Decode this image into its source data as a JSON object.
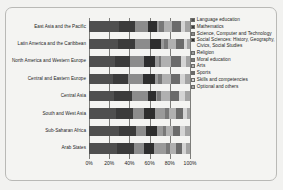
{
  "chart_data": {
    "type": "bar",
    "subtype": "stacked-horizontal-100-percent",
    "title": "",
    "xlabel": "",
    "ylabel": "",
    "xlim": [
      0,
      100
    ],
    "xticks": [
      0,
      20,
      40,
      60,
      80,
      100
    ],
    "xtick_labels": [
      "0%",
      "20%",
      "40%",
      "60%",
      "80%",
      "100%"
    ],
    "grid": true,
    "legend_position": "right",
    "categories": [
      "East Asia and the Pacific",
      "Latin America and the Caribbean",
      "North America and Western Europe",
      "Central and Eastern Europe",
      "Central Asia",
      "South and West Asia",
      "Sub-Saharan Africa",
      "Arab States"
    ],
    "series": [
      {
        "name": "Language education",
        "color": "#4f4f4f",
        "values": [
          30,
          29,
          26,
          24,
          25,
          27,
          30,
          28
        ]
      },
      {
        "name": "Mathematics",
        "color": "#3b3b3b",
        "values": [
          16,
          17,
          15,
          15,
          18,
          17,
          17,
          17
        ]
      },
      {
        "name": "Science, Computer and Technology",
        "color": "#8c8c8c",
        "values": [
          12,
          14,
          13,
          14,
          15,
          10,
          9,
          9
        ]
      },
      {
        "name": "Social Sciences: History, Geography, Civics, Social Studies",
        "color": "#2e2e2e",
        "values": [
          9,
          11,
          11,
          12,
          8,
          11,
          11,
          10
        ]
      },
      {
        "name": "Religion",
        "color": "#9a9a9a",
        "values": [
          2,
          3,
          4,
          3,
          1,
          10,
          6,
          12
        ]
      },
      {
        "name": "Moral education",
        "color": "#787878",
        "values": [
          5,
          4,
          2,
          4,
          4,
          4,
          3,
          4
        ]
      },
      {
        "name": "Arts",
        "color": "#b0b0b0",
        "values": [
          8,
          8,
          10,
          9,
          9,
          7,
          7,
          6
        ]
      },
      {
        "name": "Sports",
        "color": "#6b6b6b",
        "values": [
          9,
          8,
          10,
          9,
          9,
          7,
          7,
          6
        ]
      },
      {
        "name": "Skills and competencies",
        "color": "#d4d4d4",
        "values": [
          4,
          3,
          5,
          5,
          6,
          4,
          5,
          4
        ]
      },
      {
        "name": "Optional and others",
        "color": "#a3a3a3",
        "values": [
          5,
          3,
          4,
          5,
          5,
          3,
          5,
          4
        ]
      }
    ]
  },
  "legend": {
    "items": [
      {
        "label": "Language education",
        "color": "#4f4f4f"
      },
      {
        "label": "Mathematics",
        "color": "#3b3b3b"
      },
      {
        "label": "Science, Computer and Technology",
        "color": "#8c8c8c"
      },
      {
        "label": "Social Sciences: History, Geography, Civics, Social Studies",
        "color": "#2e2e2e"
      },
      {
        "label": "Religion",
        "color": "#9a9a9a"
      },
      {
        "label": "Moral education",
        "color": "#787878"
      },
      {
        "label": "Arts",
        "color": "#b0b0b0"
      },
      {
        "label": "Sports",
        "color": "#6b6b6b"
      },
      {
        "label": "Skills and competencies",
        "color": "#d4d4d4"
      },
      {
        "label": "Optional and others",
        "color": "#a3a3a3"
      }
    ]
  },
  "colors": {
    "background": "#f4f4f2",
    "frame_border": "#b9b9b6",
    "axis": "#7d7d7a",
    "text": "#232323"
  }
}
